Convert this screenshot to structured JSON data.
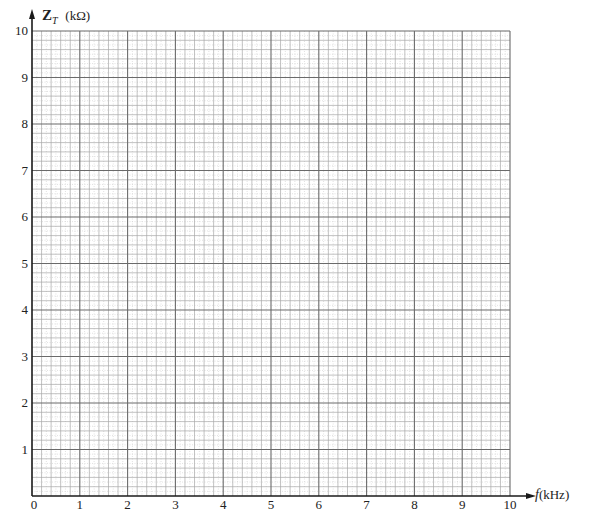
{
  "chart_data": {
    "type": "line",
    "title": "",
    "xlabel": "f (kHz)",
    "ylabel": "Z_T (kΩ)",
    "ylabel_main": "Z",
    "ylabel_sub": "T",
    "ylabel_unit": "(kΩ)",
    "xlabel_var": "f",
    "xlabel_unit": "(kHz)",
    "xlim": [
      0,
      10
    ],
    "ylim": [
      0,
      10
    ],
    "xticks": [
      "0",
      "1",
      "2",
      "3",
      "4",
      "5",
      "6",
      "7",
      "8",
      "9",
      "10"
    ],
    "yticks": [
      "1",
      "2",
      "3",
      "4",
      "5",
      "6",
      "7",
      "8",
      "9",
      "10"
    ],
    "grid": true,
    "minor_divisions_per_unit": 5,
    "series": [],
    "note": "Blank graph-paper grid for plotting total impedance vs frequency"
  },
  "colors": {
    "axis": "#1a1a1a",
    "major_grid": "#6a6a6a",
    "minor_grid": "#a8a8a8",
    "fine_grid": "#cfcfcf"
  }
}
